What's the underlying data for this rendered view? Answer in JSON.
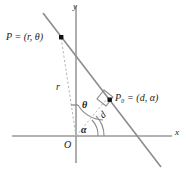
{
  "figure": {
    "type": "geometry-diagram",
    "background_color": "#ffffff",
    "axis_color": "#9a9a9a",
    "line_color": "#8c8c8c",
    "dash_color": "#b0b0b0",
    "marker_color": "#111111",
    "text_color": "#1a1a1a"
  },
  "axes": {
    "x_label": "x",
    "y_label": "y",
    "origin_label": "O"
  },
  "points": [
    {
      "id": "P",
      "name": "point-p",
      "label_main": "P",
      "label_eq": " = (",
      "label_coord1": "r",
      "label_sep": ", ",
      "label_coord2": "θ",
      "label_close": ")",
      "full_label": "P = (r, θ)"
    },
    {
      "id": "P0",
      "name": "point-p-zero",
      "label_main": "P",
      "label_subscript": "0",
      "label_eq": " = (",
      "label_coord1": "d",
      "label_sep": ", ",
      "label_coord2": "α",
      "label_close": ")",
      "full_label": "P₀ = (d, α)"
    }
  ],
  "segments": [
    {
      "id": "r",
      "name": "segment-r",
      "label": "r",
      "meaning": "distance from origin to P"
    },
    {
      "id": "d",
      "name": "segment-d",
      "label": "d",
      "meaning": "perpendicular distance from origin to line"
    }
  ],
  "angles": [
    {
      "id": "theta",
      "name": "angle-theta",
      "label": "θ",
      "meaning": "angle from y-axis reference to OP"
    },
    {
      "id": "alpha",
      "name": "angle-alpha",
      "label": "α",
      "meaning": "angle from x-axis to OP0"
    }
  ],
  "marks": [
    {
      "id": "right-angle",
      "name": "right-angle-mark",
      "label": ""
    }
  ]
}
